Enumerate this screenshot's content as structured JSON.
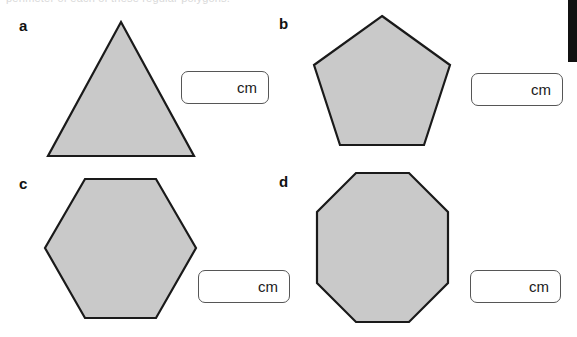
{
  "page": {
    "top_cut_text": "perimeter of each of these regular polygons.",
    "background_color": "#ffffff",
    "shape_fill_color": "#c9c9c9",
    "shape_stroke_color": "#1a1a1a"
  },
  "exercises": [
    {
      "label": "a",
      "shape": "triangle",
      "sides": 3,
      "answer_box": {
        "value": "",
        "unit": "cm",
        "placeholder": ""
      }
    },
    {
      "label": "b",
      "shape": "pentagon",
      "sides": 5,
      "answer_box": {
        "value": "",
        "unit": "cm",
        "placeholder": ""
      }
    },
    {
      "label": "c",
      "shape": "hexagon",
      "sides": 6,
      "answer_box": {
        "value": "",
        "unit": "cm",
        "placeholder": ""
      }
    },
    {
      "label": "d",
      "shape": "octagon",
      "sides": 8,
      "answer_box": {
        "value": "",
        "unit": "cm",
        "placeholder": ""
      }
    }
  ]
}
